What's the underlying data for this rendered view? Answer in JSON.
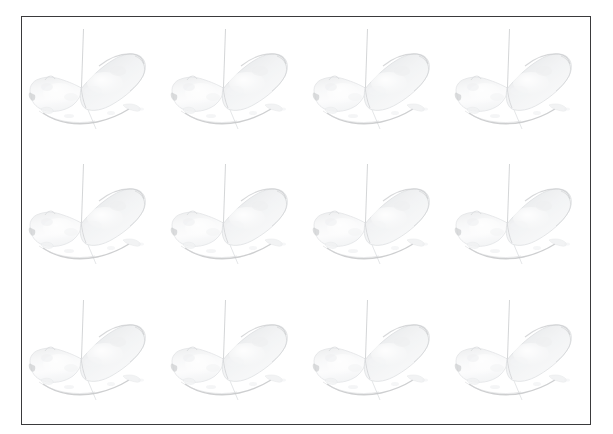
{
  "canvas": {
    "width": 613,
    "height": 434,
    "background_color": "#ffffff"
  },
  "frame": {
    "border_color": "#3a3a3c",
    "border_width_px": 1.5,
    "fill_color": "#ffffff",
    "left": 21,
    "top": 16,
    "width": 570,
    "height": 409
  },
  "grid": {
    "columns": 4,
    "rows": 3,
    "total_tiles": 12,
    "layout": "uniform repeating grid of identical renders"
  },
  "subject": {
    "description": "faint grayscale 3D render of a curved organic object resembling a banana or dumpling resting on a surface, pierced by a thin vertical probe line",
    "body_fill_color": "#f4f4f5",
    "body_edge_color": "#b9bcc0",
    "shadow_color": "#9a9da2",
    "probe_color": "#9fa2a7",
    "opacity": 0.55
  },
  "tiles": [
    {
      "index": 1,
      "row": 1,
      "column": 1,
      "label": "render-1"
    },
    {
      "index": 2,
      "row": 1,
      "column": 2,
      "label": "render-2"
    },
    {
      "index": 3,
      "row": 1,
      "column": 3,
      "label": "render-3"
    },
    {
      "index": 4,
      "row": 1,
      "column": 4,
      "label": "render-4"
    },
    {
      "index": 5,
      "row": 2,
      "column": 1,
      "label": "render-5"
    },
    {
      "index": 6,
      "row": 2,
      "column": 2,
      "label": "render-6"
    },
    {
      "index": 7,
      "row": 2,
      "column": 3,
      "label": "render-7"
    },
    {
      "index": 8,
      "row": 2,
      "column": 4,
      "label": "render-8"
    },
    {
      "index": 9,
      "row": 3,
      "column": 1,
      "label": "render-9"
    },
    {
      "index": 10,
      "row": 3,
      "column": 2,
      "label": "render-10"
    },
    {
      "index": 11,
      "row": 3,
      "column": 3,
      "label": "render-11"
    },
    {
      "index": 12,
      "row": 3,
      "column": 4,
      "label": "render-12"
    }
  ]
}
